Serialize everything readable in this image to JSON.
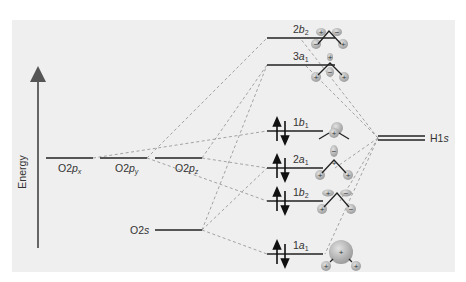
{
  "diagram": {
    "type": "molecular-orbital-diagram",
    "axis": {
      "label": "Energy",
      "direction": "up"
    },
    "colors": {
      "background": "#efefef",
      "line": "#222222",
      "dash": "#9a9a9a",
      "lobe": "#b8b8b8"
    },
    "atomic_orbitals_O": [
      {
        "id": "o2px",
        "prefix": "O2",
        "orb": "p",
        "sub": "x",
        "energy_level": "2p"
      },
      {
        "id": "o2py",
        "prefix": "O2",
        "orb": "p",
        "sub": "y",
        "energy_level": "2p"
      },
      {
        "id": "o2pz",
        "prefix": "O2",
        "orb": "p",
        "sub": "z",
        "energy_level": "2p"
      },
      {
        "id": "o2s",
        "prefix": "O2",
        "orb": "s",
        "sub": "",
        "energy_level": "2s"
      }
    ],
    "atomic_orbitals_H": [
      {
        "id": "h1s",
        "label_main": "H1",
        "label_it": "s",
        "degeneracy": 2
      }
    ],
    "molecular_orbitals": [
      {
        "id": "2b2",
        "num": "2",
        "sym": "b",
        "sub": "2",
        "occupied": false,
        "electrons": 0
      },
      {
        "id": "3a1",
        "num": "3",
        "sym": "a",
        "sub": "1",
        "occupied": false,
        "electrons": 0
      },
      {
        "id": "1b1",
        "num": "1",
        "sym": "b",
        "sub": "1",
        "occupied": true,
        "electrons": 2
      },
      {
        "id": "2a1",
        "num": "2",
        "sym": "a",
        "sub": "1",
        "occupied": true,
        "electrons": 2
      },
      {
        "id": "1b2",
        "num": "1",
        "sym": "b",
        "sub": "2",
        "occupied": true,
        "electrons": 2
      },
      {
        "id": "1a1",
        "num": "1",
        "sym": "a",
        "sub": "1",
        "occupied": true,
        "electrons": 2
      }
    ],
    "lobe_signs": {
      "2b2": [
        "+",
        "−",
        "−",
        "+"
      ],
      "3a1": [
        "+",
        "+",
        "+",
        "−"
      ],
      "1b1": [
        "+"
      ],
      "2a1": [
        "−",
        "+",
        "+",
        "+"
      ],
      "1b2": [
        "+",
        "−",
        "+",
        "−"
      ],
      "1a1": [
        "+",
        "+",
        "+"
      ]
    }
  }
}
